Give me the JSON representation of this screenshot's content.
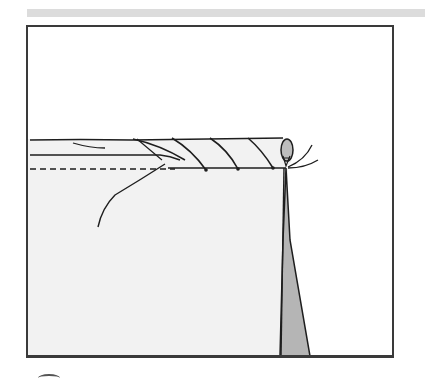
{
  "figure": {
    "caption": "",
    "colors": {
      "fabric": "#f2f2f2",
      "outline": "#1e1e1e",
      "thread_tail": "#b5b5b5",
      "frame": "#3a3a3a",
      "top_band": "#dcdcdc"
    },
    "elements": {
      "rolled_edge": "rolled-hem",
      "stitches": 4,
      "guide_line": "dashed-seam-line",
      "needle": "needle-with-thread",
      "hanging_thread": "thread-tail"
    }
  }
}
